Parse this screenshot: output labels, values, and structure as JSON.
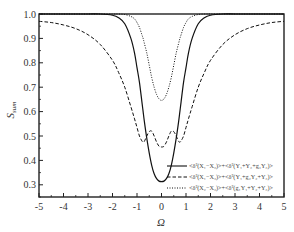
{
  "chart_data": {
    "type": "line",
    "title": "",
    "xlabel": "Ω",
    "ylabel": "S_sum",
    "ylabel_main": "S",
    "ylabel_sub": "sum",
    "xlim": [
      -5,
      5
    ],
    "ylim": [
      0.25,
      1.0
    ],
    "x_ticks": [
      -5,
      -4,
      -3,
      -2,
      -1,
      0,
      1,
      2,
      3,
      4,
      5
    ],
    "x_tick_labels": [
      "-5",
      "-4",
      "-3",
      "-2",
      "-1",
      "0",
      "1",
      "2",
      "3",
      "4",
      "5"
    ],
    "y_ticks": [
      0.3,
      0.4,
      0.5,
      0.6,
      0.7,
      0.8,
      0.9,
      1.0
    ],
    "y_tick_labels": [
      "0.3",
      "0.4",
      "0.5",
      "0.6",
      "0.7",
      "0.8",
      "0.9",
      "1.0"
    ],
    "grid": false,
    "legend_position": "lower right",
    "x": [
      -5,
      -4.5,
      -4,
      -3.5,
      -3,
      -2.5,
      -2,
      -1.75,
      -1.5,
      -1.25,
      -1.1,
      -1,
      -0.9,
      -0.8,
      -0.75,
      -0.7,
      -0.6,
      -0.5,
      -0.4,
      -0.3,
      -0.2,
      -0.1,
      0,
      0.1,
      0.2,
      0.3,
      0.4,
      0.5,
      0.6,
      0.7,
      0.75,
      0.8,
      0.9,
      1,
      1.1,
      1.25,
      1.5,
      1.75,
      2,
      2.5,
      3,
      3.5,
      4,
      4.5,
      5
    ],
    "series": [
      {
        "name": "<δ²(X₁−X₂)>+<δ²(Y₁+Y₂+g₃Y₃)>",
        "style": "solid",
        "values": [
          1.0,
          1.0,
          1.0,
          1.0,
          1.0,
          1.0,
          0.995,
          0.985,
          0.96,
          0.9,
          0.84,
          0.78,
          0.72,
          0.64,
          0.6,
          0.56,
          0.49,
          0.43,
          0.38,
          0.345,
          0.325,
          0.315,
          0.313,
          0.315,
          0.325,
          0.345,
          0.38,
          0.43,
          0.49,
          0.56,
          0.6,
          0.64,
          0.72,
          0.78,
          0.84,
          0.9,
          0.96,
          0.985,
          0.995,
          1.0,
          1.0,
          1.0,
          1.0,
          1.0,
          1.0
        ]
      },
      {
        "name": "<δ²(X₁−X₃)>+<δ²(Y₁+g₂Y₂+Y₃)>",
        "style": "dashed",
        "values": [
          0.97,
          0.965,
          0.955,
          0.94,
          0.915,
          0.875,
          0.81,
          0.76,
          0.7,
          0.62,
          0.57,
          0.535,
          0.5,
          0.48,
          0.475,
          0.478,
          0.5,
          0.518,
          0.52,
          0.5,
          0.475,
          0.458,
          0.455,
          0.458,
          0.475,
          0.5,
          0.52,
          0.518,
          0.5,
          0.478,
          0.475,
          0.48,
          0.5,
          0.535,
          0.57,
          0.62,
          0.7,
          0.76,
          0.81,
          0.875,
          0.915,
          0.94,
          0.955,
          0.965,
          0.97
        ]
      },
      {
        "name": "<δ²(X₂−X₃)>+<δ²(g₁Y₁+Y₂+Y₃)>",
        "style": "dotted",
        "values": [
          1.0,
          1.0,
          1.0,
          1.0,
          1.0,
          1.0,
          1.0,
          1.0,
          0.998,
          0.99,
          0.98,
          0.965,
          0.945,
          0.915,
          0.9,
          0.88,
          0.84,
          0.79,
          0.74,
          0.7,
          0.67,
          0.652,
          0.646,
          0.652,
          0.67,
          0.7,
          0.74,
          0.79,
          0.84,
          0.88,
          0.9,
          0.915,
          0.945,
          0.965,
          0.98,
          0.99,
          0.998,
          1.0,
          1.0,
          1.0,
          1.0,
          1.0,
          1.0,
          1.0,
          1.0
        ]
      }
    ]
  },
  "legend": {
    "items": [
      {
        "label": "<δ²(X₁−X₂)>+<δ²(Y₁+Y₂+g₃Y₃)>",
        "style": "solid"
      },
      {
        "label": "<δ²(X₁−X₃)>+<δ²(Y₁+g₂Y₂+Y₃)>",
        "style": "dashed"
      },
      {
        "label": "<δ²(X₂−X₃)>+<δ²(g₁Y₁+Y₂+Y₃)>",
        "style": "dotted"
      }
    ]
  },
  "colors": {
    "axis": "#222222",
    "line": "#111111",
    "text": "#333333",
    "background": "#ffffff"
  }
}
